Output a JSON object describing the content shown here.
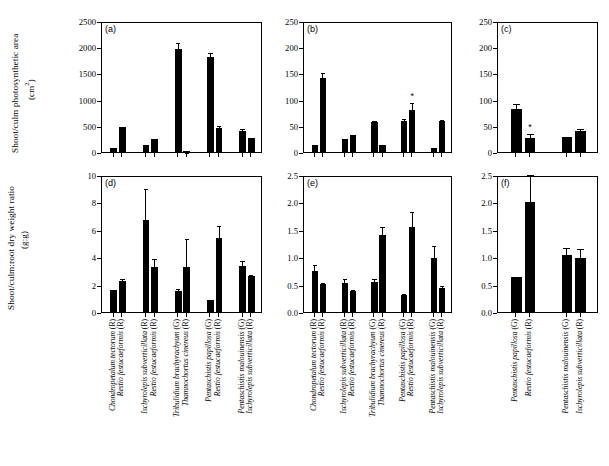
{
  "figure": {
    "axis_titles": {
      "top_y": "Shoot/culm photosynthetic area",
      "top_y_unit": "(cm²)",
      "bottom_y": "Shoot/culm:root dry weight ratio",
      "bottom_y_unit": "(g:g)"
    }
  },
  "chart_data": [
    {
      "type": "bar",
      "panel": "(a)",
      "title": "",
      "ylabel": "Shoot/culm photosynthetic area (cm2)",
      "xlabel": "",
      "ylim": [
        0,
        2500
      ],
      "yticks": [
        0,
        500,
        1000,
        1500,
        2000,
        2500
      ],
      "ytick_labels": [
        "0",
        "500",
        "1000",
        "1500",
        "2000",
        "2500"
      ],
      "grid": false,
      "legend": "none",
      "categories": [
        "Chondropetalum tectorum (R)",
        "Restio festucaeformis (R)",
        "Ischyrolepis subverticillata (R)",
        "Restio festucaeformis (R)",
        "Tribulidium brachyrachyum (G)",
        "Thamnochortus cinereus (R)",
        "Pentaschistis papillosa (G)",
        "Restio festucaeformis (R)",
        "Pentaschistis malouinensis (G)",
        "Ischyrolepis subverticillata (R)"
      ],
      "values": [
        80,
        470,
        135,
        250,
        1975,
        20,
        1805,
        450,
        400,
        270
      ],
      "errors": [
        18,
        30,
        22,
        42,
        145,
        8,
        130,
        75,
        80,
        35
      ],
      "significance": []
    },
    {
      "type": "bar",
      "panel": "(b)",
      "title": "",
      "ylabel": "Shoot/culm photosynthetic area (cm2)",
      "xlabel": "",
      "ylim": [
        0,
        250
      ],
      "yticks": [
        0,
        50,
        100,
        150,
        200,
        250
      ],
      "ytick_labels": [
        "0",
        "50",
        "100",
        "150",
        "200",
        "250"
      ],
      "grid": false,
      "legend": "none",
      "categories": [
        "Chondropetalum tectorum (R)",
        "Restio festucaeformis (R)",
        "Ischyrolepis subverticillata (R)",
        "Restio festucaeformis (R)",
        "Tribulidium brachyrachyum (G)",
        "Thamnochortus cinereus (R)",
        "Pentaschistis papillosa (G)",
        "Restio festucaeformis (R)",
        "Pentaschistis malouinensis (G)",
        "Ischyrolepis subverticillata (R)"
      ],
      "values": [
        14,
        142,
        24,
        33,
        57,
        14,
        59,
        81,
        7,
        59
      ],
      "errors": [
        3,
        13,
        4,
        3,
        6,
        4,
        8,
        16,
        2,
        6
      ],
      "significance": [
        {
          "index": 7,
          "marker": "*"
        }
      ]
    },
    {
      "type": "bar",
      "panel": "(c)",
      "title": "",
      "ylabel": "Shoot/culm photosynthetic area (cm2)",
      "xlabel": "",
      "ylim": [
        0,
        250
      ],
      "yticks": [
        0,
        50,
        100,
        150,
        200,
        250
      ],
      "ytick_labels": [
        "0",
        "50",
        "100",
        "150",
        "200",
        "250"
      ],
      "grid": false,
      "legend": "none",
      "categories": [
        "Pentaschistis papillosa (G)",
        "Restio festucaeformis (R)",
        "Pentaschistis malouinensis (G)",
        "Ischyrolepis subverticillata (R)"
      ],
      "values": [
        83,
        27,
        29,
        41
      ],
      "errors": [
        12,
        11,
        4,
        7
      ],
      "significance": [
        {
          "index": 1,
          "marker": "*"
        }
      ]
    },
    {
      "type": "bar",
      "panel": "(d)",
      "title": "",
      "ylabel": "Shoot/culm:root dry weight ratio (g:g)",
      "xlabel": "",
      "ylim": [
        0,
        10
      ],
      "yticks": [
        0,
        2,
        4,
        6,
        8,
        10
      ],
      "ytick_labels": [
        "0",
        "2",
        "4",
        "6",
        "8",
        "10"
      ],
      "grid": false,
      "legend": "none",
      "categories": [
        "Chondropetalum tectorum (R)",
        "Restio festucaeformis (R)",
        "Ischyrolepis subverticillata (R)",
        "Restio festucaeformis (R)",
        "Tribulidium brachyrachyum (G)",
        "Thamnochortus cinereus (R)",
        "Pentaschistis papillosa (G)",
        "Restio festucaeformis (R)",
        "Pentaschistis malouinensis (G)",
        "Ischyrolepis subverticillata (R)"
      ],
      "values": [
        1.6,
        2.25,
        6.7,
        3.3,
        1.5,
        3.3,
        0.9,
        5.4,
        3.35,
        2.65
      ],
      "errors": [
        0.18,
        0.33,
        2.4,
        0.72,
        0.32,
        2.2,
        0.08,
        1.0,
        0.5,
        0.2
      ],
      "significance": []
    },
    {
      "type": "bar",
      "panel": "(e)",
      "title": "",
      "ylabel": "Shoot/culm:root dry weight ratio (g:g)",
      "xlabel": "",
      "ylim": [
        0,
        2.5
      ],
      "yticks": [
        0.0,
        0.5,
        1.0,
        1.5,
        2.0,
        2.5
      ],
      "ytick_labels": [
        "0.0",
        "0.5",
        "1.0",
        "1.5",
        "2.0",
        "2.5"
      ],
      "grid": false,
      "legend": "none",
      "categories": [
        "Chondropetalum tectorum (R)",
        "Restio festucaeformis (R)",
        "Ischyrolepis subverticillata (R)",
        "Restio festucaeformis (R)",
        "Tribulidium brachyrachyum (G)",
        "Thamnochortus cinereus (R)",
        "Pentaschistis papillosa (G)",
        "Restio festucaeformis (R)",
        "Pentaschistis malouinensis (G)",
        "Ischyrolepis subverticillata (R)"
      ],
      "values": [
        0.75,
        0.52,
        0.53,
        0.39,
        0.54,
        1.4,
        0.31,
        1.56,
        0.98,
        0.44
      ],
      "errors": [
        0.14,
        0.04,
        0.1,
        0.05,
        0.09,
        0.18,
        0.06,
        0.3,
        0.27,
        0.08
      ],
      "significance": []
    },
    {
      "type": "bar",
      "panel": "(f)",
      "title": "",
      "ylabel": "Shoot/culm:root dry weight ratio (g:g)",
      "xlabel": "",
      "ylim": [
        0,
        2.5
      ],
      "yticks": [
        0.0,
        0.5,
        1.0,
        1.5,
        2.0,
        2.5
      ],
      "ytick_labels": [
        "0.0",
        "0.5",
        "1.0",
        "1.5",
        "2.0",
        "2.5"
      ],
      "grid": false,
      "legend": "none",
      "categories": [
        "Pentaschistis papillosa (G)",
        "Restio festucaeformis (R)",
        "Pentaschistis malouinensis (G)",
        "Ischyrolepis subverticillata (R)"
      ],
      "values": [
        0.63,
        2.01,
        1.04,
        0.99
      ],
      "errors": [
        0.05,
        0.52,
        0.17,
        0.2
      ],
      "significance": []
    }
  ]
}
